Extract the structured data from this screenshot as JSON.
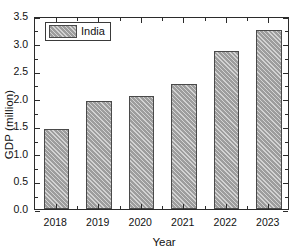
{
  "chart_data": {
    "type": "bar",
    "title": "",
    "subtitle": "",
    "xlabel": "Year",
    "ylabel": "GDP (million)",
    "categories": [
      "2018",
      "2019",
      "2020",
      "2021",
      "2022",
      "2023"
    ],
    "series": [
      {
        "name": "India",
        "values": [
          1.45,
          1.96,
          2.05,
          2.27,
          2.86,
          3.25
        ]
      }
    ],
    "ylim": [
      0.0,
      3.5
    ],
    "ytick_labels": [
      "0.0",
      "0.5",
      "1.0",
      "1.5",
      "2.0",
      "2.5",
      "3.0",
      "3.5"
    ],
    "ytick_values": [
      0.0,
      0.5,
      1.0,
      1.5,
      2.0,
      2.5,
      3.0,
      3.5
    ],
    "y_minor_ticks": true,
    "grid": false,
    "legend": {
      "entries": [
        "India"
      ],
      "position": "top-left-inside",
      "boxed": true
    },
    "style": {
      "bar_fill": "#9d9d9d",
      "bar_edge": "#4a4a4a",
      "hatch": "diagonal-45",
      "frame_color": "#2b2b2b",
      "background": "#ffffff",
      "ticks": "inward-all-sides"
    }
  }
}
